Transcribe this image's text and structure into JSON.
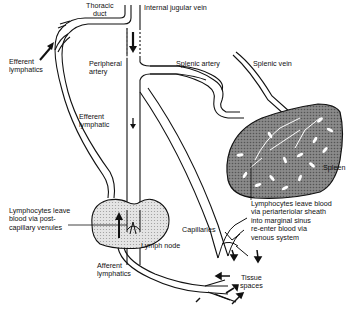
{
  "diagram": {
    "type": "lymphocyte-recirculation",
    "labels": {
      "thoracic_duct": "Thoracic\nduct",
      "internal_jugular_vein": "Internal jugular vein",
      "efferent_lymphatics": "Efferent\nlymphatics",
      "peripheral_artery": "Peripheral\nartery",
      "splenic_artery": "Splenic artery",
      "splenic_vein": "Splenic vein",
      "efferent_lymphatic": "Efferent\nlymphatic",
      "spleen": "Spleen",
      "lymphocytes_leave_postcapillary": "Lymphocytes leave\nblood via post-\ncapillary venules",
      "lymphocytes_leave_spleen": "Lymphocytes leave blood\nvia periarteriolar sheath\ninto marginal sinus\nre-enter blood via\nvenous system",
      "lymph_node": "Lymph node",
      "capillaries": "Capillaries",
      "afferent_lymphatics": "Afferent\nlymphatics",
      "tissue_spaces": "Tissue\nspaces"
    },
    "colors": {
      "line": "#111111",
      "node_fill": "#e2e2e2",
      "spleen_fill": "#7a7a7a",
      "background": "#ffffff"
    }
  }
}
